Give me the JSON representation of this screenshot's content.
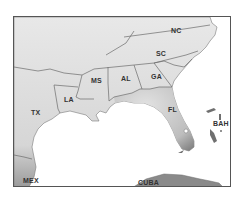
{
  "map": {
    "region": "Southeastern United States",
    "colors": {
      "land": "#e6e6e6",
      "land_shadow": "#8a8a8a",
      "water": "#ffffff",
      "border": "#6b6b6b",
      "frame": "#555555",
      "label": "#333333"
    },
    "labels": {
      "nc": "NC",
      "sc": "SC",
      "ga": "GA",
      "al": "AL",
      "ms": "MS",
      "la": "LA",
      "tx": "TX",
      "fl": "FL",
      "bah": "BAH",
      "mex": "MEX",
      "cuba": "CUBA"
    }
  }
}
